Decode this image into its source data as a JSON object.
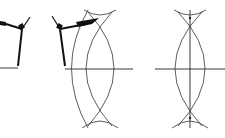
{
  "diagram": {
    "caption_faint": "",
    "colors": {
      "ink": "#111111",
      "arc": "#333333",
      "background": "#ffffff"
    },
    "panels": [
      {
        "id": "step-1",
        "description": "Compass set on segment endpoint (partially cropped)",
        "segment": {
          "x1": 0,
          "y1": 68,
          "x2": 18,
          "y2": 68
        },
        "compass": {
          "hinge": [
            22,
            28
          ],
          "leg_tip": [
            18,
            67
          ],
          "arm_end": [
            0,
            20
          ]
        }
      },
      {
        "id": "step-2",
        "description": "Compass drawing arcs above and below the segment",
        "segment": {
          "x1": 65,
          "y1": 69,
          "x2": 133,
          "y2": 69
        },
        "compass": {
          "hinge": [
            60,
            28
          ],
          "leg_tip": [
            65,
            67
          ],
          "arm_end": [
            99,
            19
          ]
        },
        "arc_intersections": [
          [
            100,
            18
          ],
          [
            100,
            118
          ]
        ]
      },
      {
        "id": "step-3",
        "description": "Completed perpendicular bisector through arc intersections",
        "segment": {
          "x1": 155,
          "y1": 69,
          "x2": 225,
          "y2": 69
        },
        "bisector": {
          "x1": 190,
          "y1": 10,
          "x2": 190,
          "y2": 128
        },
        "arc_intersections": [
          [
            190,
            18
          ],
          [
            190,
            118
          ]
        ]
      }
    ]
  }
}
